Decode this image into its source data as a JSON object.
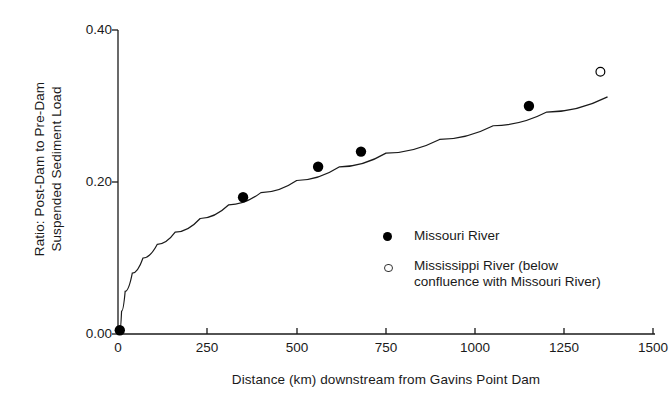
{
  "chart_data": {
    "type": "scatter",
    "title": "",
    "xlabel": "Distance (km) downstream from Gavins Point Dam",
    "ylabel": "Ratio: Post-Dam to Pre-Dam\nSuspended Sediment Load",
    "xlim": [
      0,
      1500
    ],
    "ylim": [
      0.0,
      0.4
    ],
    "xticks": [
      "0",
      "250",
      "500",
      "750",
      "1000",
      "1250",
      "1500"
    ],
    "xtick_values": [
      0,
      250,
      500,
      750,
      1000,
      1250,
      1500
    ],
    "yticks": [
      "0.00",
      "0.20",
      "0.40"
    ],
    "ytick_values": [
      0.0,
      0.2,
      0.4
    ],
    "grid": false,
    "legend_position": "center-right",
    "series": [
      {
        "name": "Missouri River",
        "marker": "filled-circle",
        "color": "#000000",
        "points": [
          {
            "x": 5,
            "y": 0.005
          },
          {
            "x": 350,
            "y": 0.18
          },
          {
            "x": 560,
            "y": 0.22
          },
          {
            "x": 680,
            "y": 0.24
          },
          {
            "x": 1150,
            "y": 0.3
          }
        ]
      },
      {
        "name": "Mississippi River (below\nconfluence with Missouri River)",
        "marker": "open-circle",
        "color": "#000000",
        "points": [
          {
            "x": 1350,
            "y": 0.345
          }
        ]
      }
    ],
    "fit_curve": {
      "description": "power/log fit through Missouri River points",
      "x_range": [
        5,
        1370
      ],
      "points": [
        {
          "x": 5,
          "y": 0.004
        },
        {
          "x": 10,
          "y": 0.03
        },
        {
          "x": 20,
          "y": 0.056
        },
        {
          "x": 40,
          "y": 0.08
        },
        {
          "x": 70,
          "y": 0.1
        },
        {
          "x": 110,
          "y": 0.118
        },
        {
          "x": 160,
          "y": 0.134
        },
        {
          "x": 230,
          "y": 0.152
        },
        {
          "x": 310,
          "y": 0.17
        },
        {
          "x": 400,
          "y": 0.186
        },
        {
          "x": 500,
          "y": 0.202
        },
        {
          "x": 620,
          "y": 0.22
        },
        {
          "x": 750,
          "y": 0.238
        },
        {
          "x": 900,
          "y": 0.256
        },
        {
          "x": 1050,
          "y": 0.274
        },
        {
          "x": 1200,
          "y": 0.292
        },
        {
          "x": 1370,
          "y": 0.312
        }
      ]
    }
  },
  "legend": {
    "items": [
      {
        "label": "Missouri River",
        "marker": "filled-circle"
      },
      {
        "label": "Mississippi River (below\nconfluence with Missouri River)",
        "marker": "open-circle"
      }
    ]
  }
}
